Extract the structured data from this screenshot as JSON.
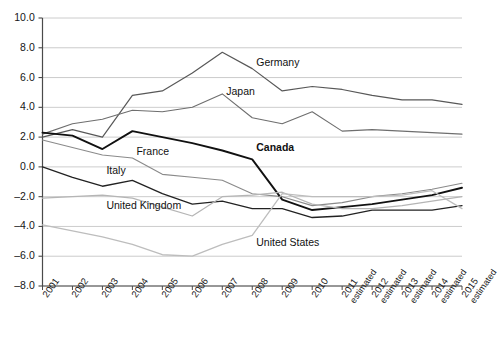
{
  "figure": {
    "title_cutoff": "",
    "background": "#ffffff",
    "axis_color": "#4a4a4a",
    "grid_color": "#bfbfbf"
  },
  "axes": {
    "y_ticks": [
      "10.0",
      "8.0",
      "6.0",
      "4.0",
      "2.0",
      "0.0",
      "-2.0",
      "-4.0",
      "-6.0",
      "-8.0"
    ],
    "y_min": -8.0,
    "y_max": 10.0,
    "y_step": 2.0,
    "x_ticks": [
      {
        "year": "2001",
        "note": ""
      },
      {
        "year": "2002",
        "note": ""
      },
      {
        "year": "2003",
        "note": ""
      },
      {
        "year": "2004",
        "note": ""
      },
      {
        "year": "2005",
        "note": ""
      },
      {
        "year": "2006",
        "note": ""
      },
      {
        "year": "2007",
        "note": ""
      },
      {
        "year": "2008",
        "note": ""
      },
      {
        "year": "2009",
        "note": ""
      },
      {
        "year": "2010",
        "note": ""
      },
      {
        "year": "2011",
        "note": "estimated"
      },
      {
        "year": "2012",
        "note": "estimated"
      },
      {
        "year": "2013",
        "note": "estimated"
      },
      {
        "year": "2014",
        "note": "estimated"
      },
      {
        "year": "2015",
        "note": "estimated"
      }
    ]
  },
  "series_labels": {
    "germany": "Germany",
    "japan": "Japan",
    "france": "France",
    "canada": "Canada",
    "italy": "Italy",
    "united_kingdom": "United Kingdom",
    "united_states": "United States"
  },
  "chart_data": {
    "type": "line",
    "title": "",
    "subtitle": "",
    "xlabel": "",
    "ylabel": "",
    "ylim": [
      -8.0,
      10.0
    ],
    "ytick_step": 2.0,
    "grid": "horizontal",
    "legend": "inline-annotations",
    "x": [
      "2001",
      "2002",
      "2003",
      "2004",
      "2005",
      "2006",
      "2007",
      "2008",
      "2009",
      "2010",
      "2011 estimated",
      "2012 estimated",
      "2013 estimated",
      "2014 estimated",
      "2015 estimated"
    ],
    "series": [
      {
        "name": "Germany",
        "color": "#585858",
        "width": 1.2,
        "values": [
          2.0,
          2.5,
          2.0,
          4.8,
          5.1,
          6.3,
          7.7,
          6.6,
          5.1,
          5.4,
          5.2,
          4.8,
          4.5,
          4.5,
          4.2
        ]
      },
      {
        "name": "Japan",
        "color": "#6e6e6e",
        "width": 1.1,
        "values": [
          2.2,
          2.9,
          3.2,
          3.8,
          3.7,
          4.0,
          4.9,
          3.3,
          2.9,
          3.7,
          2.4,
          2.5,
          2.4,
          2.3,
          2.2
        ]
      },
      {
        "name": "France",
        "color": "#8a8a8a",
        "width": 1.1,
        "values": [
          1.8,
          1.3,
          0.8,
          0.6,
          -0.5,
          -0.7,
          -0.9,
          -1.8,
          -2.0,
          -2.6,
          -2.4,
          -2.0,
          -1.8,
          -1.5,
          -1.1
        ]
      },
      {
        "name": "Canada",
        "color": "#111111",
        "width": 1.9,
        "values": [
          2.3,
          2.1,
          1.2,
          2.4,
          2.0,
          1.6,
          1.1,
          0.5,
          -2.2,
          -2.9,
          -2.7,
          -2.5,
          -2.2,
          -1.9,
          -1.4
        ]
      },
      {
        "name": "Italy",
        "color": "#222222",
        "width": 1.3,
        "values": [
          0.0,
          -0.7,
          -1.3,
          -0.9,
          -1.8,
          -2.5,
          -2.3,
          -2.8,
          -2.8,
          -3.4,
          -3.3,
          -2.9,
          -2.9,
          -2.9,
          -2.6
        ]
      },
      {
        "name": "United Kingdom",
        "color": "#b5b5b5",
        "width": 1.2,
        "values": [
          -2.1,
          -2.0,
          -1.9,
          -2.1,
          -2.7,
          -3.3,
          -2.0,
          -1.9,
          -1.7,
          -2.5,
          -2.8,
          -2.8,
          -2.6,
          -2.3,
          -2.0
        ]
      },
      {
        "name": "United States",
        "color": "#bdbdbd",
        "width": 1.3,
        "values": [
          -3.9,
          -4.3,
          -4.7,
          -5.2,
          -5.9,
          -6.0,
          -5.2,
          -4.6,
          -1.8,
          -2.0,
          -2.0,
          -2.0,
          -1.9,
          -1.6,
          -2.8
        ]
      }
    ],
    "annotations": [
      {
        "text": "Germany",
        "x": "2008",
        "y": 7.0
      },
      {
        "text": "Japan",
        "x": "2007",
        "y": 5.0
      },
      {
        "text": "France",
        "x": "2004",
        "y": 1.0
      },
      {
        "text": "Canada",
        "x": "2008",
        "y": 1.3,
        "bold": true
      },
      {
        "text": "Italy",
        "x": "2003",
        "y": -0.3
      },
      {
        "text": "United Kingdom",
        "x": "2003",
        "y": -2.6
      },
      {
        "text": "United States",
        "x": "2008",
        "y": -5.1
      }
    ]
  }
}
